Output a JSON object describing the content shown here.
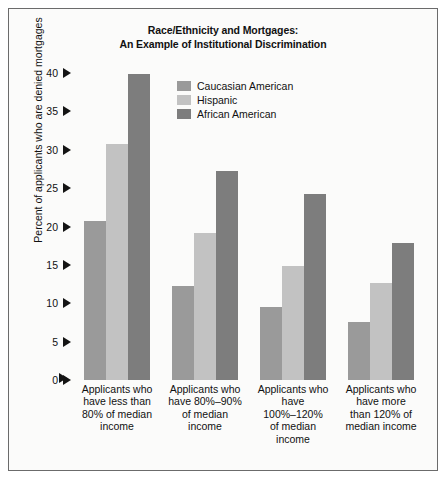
{
  "chart_data": {
    "type": "bar",
    "title": "Race/Ethnicity and Mortgages: An Example of Institutional Discrimination",
    "title_line1": "Race/Ethnicity and Mortgages:",
    "title_line2": "An Example of Institutional Discrimination",
    "xlabel": "",
    "ylabel": "Percent of applicants who are denied mortgages",
    "ylim": [
      0,
      40
    ],
    "yticks": [
      40,
      35,
      30,
      25,
      20,
      15,
      10,
      5,
      0
    ],
    "ytick_labels": [
      "40",
      "35",
      "30",
      "25",
      "20",
      "15",
      "10",
      "5",
      "0"
    ],
    "grid": false,
    "legend_position": "upper-center",
    "categories": [
      "Applicants who have less than 80% of median income",
      "Applicants who have 80%–90% of median income",
      "Applicants who have 100%–120% of median income",
      "Applicants who have more than 120% of median income"
    ],
    "category_lines": [
      [
        "Applicants who",
        "have less than",
        "80% of median",
        "income"
      ],
      [
        "Applicants who",
        "have 80%–90%",
        "of median",
        "income"
      ],
      [
        "Applicants who",
        "have",
        "100%–120%",
        "of median",
        "income"
      ],
      [
        "Applicants who",
        "have more",
        "than 120% of",
        "median income"
      ]
    ],
    "series": [
      {
        "name": "Caucasian American",
        "color": "#9a9a9a",
        "values": [
          20.7,
          12.3,
          9.5,
          7.6
        ]
      },
      {
        "name": "Hispanic",
        "color": "#c2c2c2",
        "values": [
          30.8,
          19.1,
          14.9,
          12.7
        ]
      },
      {
        "name": "African American",
        "color": "#7d7d7d",
        "values": [
          39.9,
          27.2,
          24.3,
          17.9
        ]
      }
    ]
  }
}
